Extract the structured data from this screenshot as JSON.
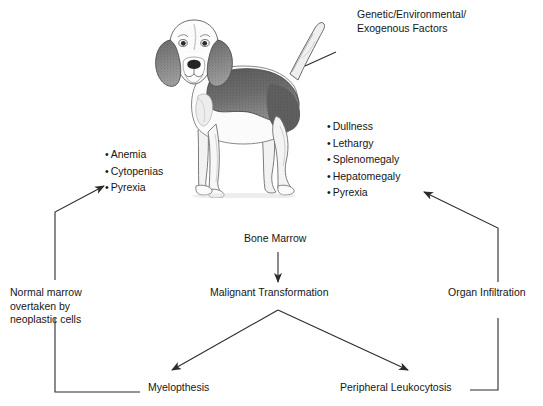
{
  "diagram": {
    "title_note": "Pathophysiology of canine leukemia flow diagram",
    "factors_label": "Genetic/Environmental/\nExogenous Factors",
    "left_signs": {
      "name": "bone-marrow-signs",
      "items": [
        "Anemia",
        "Cytopenias",
        "Pyrexia"
      ]
    },
    "right_signs": {
      "name": "organ-infiltration-signs",
      "items": [
        "Dullness",
        "Lethargy",
        "Splenomegaly",
        "Hepatomegaly",
        "Pyrexia"
      ]
    },
    "nodes": {
      "bone_marrow": "Bone Marrow",
      "malignant_transformation": "Malignant Transformation",
      "normal_marrow": "Normal marrow\novertaken by\nneoplastic cells",
      "normal_marrow_line1": "Normal marrow",
      "normal_marrow_line2": "overtaken by",
      "normal_marrow_line3": "neoplastic cells",
      "organ_infiltration": "Organ Infiltration",
      "myelopthesis": "Myelopthesis",
      "peripheral_leukocytosis": "Peripheral Leukocytosis"
    },
    "image": {
      "subject": "beagle-dog-illustration",
      "style": "grayscale pencil sketch"
    },
    "colors": {
      "background": "#ffffff",
      "text": "#161616",
      "line": "#333333",
      "dog_dark": "#4a4a4a",
      "dog_mid": "#9a9a9a",
      "dog_light": "#d8d8d8"
    }
  }
}
